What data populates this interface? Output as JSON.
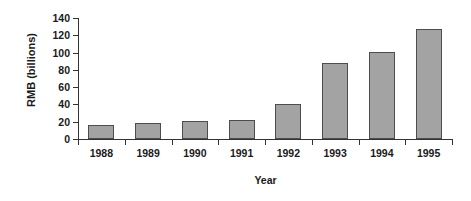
{
  "chart_data": {
    "type": "bar",
    "title": "",
    "xlabel": "Year",
    "ylabel": "RMB (billions)",
    "categories": [
      "1988",
      "1989",
      "1990",
      "1991",
      "1992",
      "1993",
      "1994",
      "1995"
    ],
    "values": [
      16,
      18,
      21,
      22,
      40,
      88,
      101,
      127
    ],
    "ylim": [
      0,
      140
    ],
    "yticks": [
      0,
      20,
      40,
      60,
      80,
      100,
      120,
      140
    ],
    "ytick_labels": [
      "0",
      "20",
      "40",
      "60",
      "80",
      "100",
      "120",
      "140"
    ],
    "grid": false,
    "legend": null,
    "bar_fill_color": "#a3a3a3",
    "bar_border_color": "#4d4d4d",
    "axis_color": "#333333",
    "background_color": "#ffffff"
  }
}
